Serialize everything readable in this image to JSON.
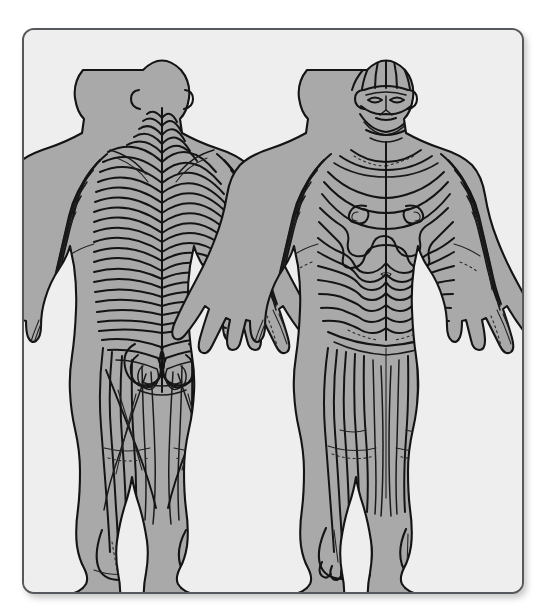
{
  "plate": {
    "kind": "anatomical-illustration",
    "subject": "dermatome-and-peripheral-nerve-distribution-chart",
    "medium": "scanned-line-drawing",
    "background_color": "#eeeeee",
    "page_color": "#ffffff",
    "skin_fill_color": "#a9a9a9",
    "ink_color": "#141414",
    "border_color": "#55585c",
    "border_radius_px": 12,
    "has_visible_text": false,
    "label_text": "",
    "caption_text": "",
    "figure_number": ""
  },
  "figures": [
    {
      "id": "posterior-figure",
      "name": "posterior-body-view",
      "position": "left",
      "view": "posterior",
      "description": "Full-length human figure seen from behind with arms abducted slightly and palms facing backward; segmental dermatome bands drawn as nested chevrons converging on the midline of the back, looping ovals over the buttocks and longitudinal stripes down the legs.",
      "head": {
        "hair": false,
        "face_visible": false,
        "ears_visible": true
      },
      "feet": {
        "toes_visible": false,
        "heels_visible": true
      },
      "band_count_trunk": 22,
      "pattern": [
        "chevron-bands",
        "buttock-loops",
        "longitudinal-leg-stripes",
        "oblique-arm-stripes"
      ]
    },
    {
      "id": "anterior-figure",
      "name": "anterior-body-view",
      "position": "right",
      "view": "anterior",
      "description": "Full-length human figure seen from the front with arms abducted slightly and palms facing forward; trigeminal branch lines radiate over the face and scalp, wavy segmental bands sweep across the chest and abdomen around spiral nipple markings, and long stripes run down the thighs, legs and dorsum of the feet.",
      "head": {
        "hair": false,
        "face_visible": true,
        "ears_visible": true
      },
      "feet": {
        "toes_visible": true,
        "heels_visible": false
      },
      "band_count_trunk": 18,
      "pattern": [
        "facial-trigeminal-radials",
        "wavy-trunk-bands",
        "nipple-spirals",
        "longitudinal-leg-stripes",
        "oblique-arm-stripes"
      ]
    }
  ],
  "layout": {
    "card": {
      "x": 22,
      "y": 28,
      "width": 498,
      "height": 562
    },
    "viewbox": {
      "width": 498,
      "height": 562
    }
  }
}
